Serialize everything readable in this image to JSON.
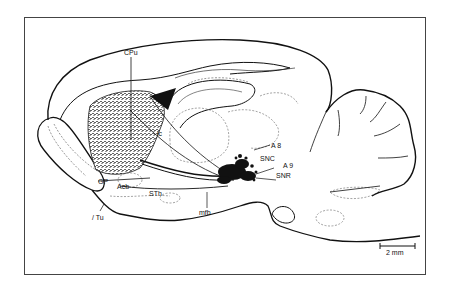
{
  "figure": {
    "labels": {
      "cpu": "CPu",
      "ic": "ic",
      "a8": "A 8",
      "snc": "SNC",
      "a9": "A 9",
      "snr": "SNR",
      "gp": "GP",
      "acb": "Acb",
      "sth": "STh",
      "tu": "Tu",
      "mfb": "mfb"
    },
    "scale_bar": {
      "label": "2 mm"
    }
  }
}
